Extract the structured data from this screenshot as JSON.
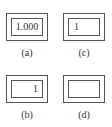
{
  "panels": [
    {
      "id": "a",
      "caption": "(a)",
      "value": "1.000",
      "align": "center"
    },
    {
      "id": "b",
      "caption": "(b)",
      "value": "1",
      "align": "right"
    },
    {
      "id": "c",
      "caption": "(c)",
      "value": "1",
      "align": "left"
    },
    {
      "id": "d",
      "caption": "(d)",
      "value": "",
      "align": "none"
    }
  ]
}
